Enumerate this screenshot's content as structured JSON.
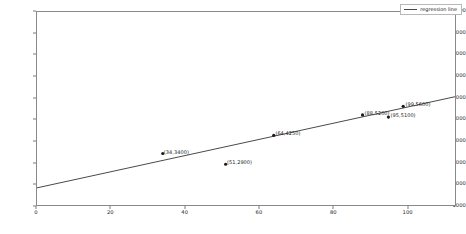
{
  "chart_data": {
    "type": "scatter",
    "title": "",
    "xlabel": "",
    "ylabel": "",
    "xlim": [
      0,
      113
    ],
    "ylim": [
      1000,
      10000
    ],
    "grid": false,
    "legend_position": "upper right",
    "legend": [
      "regression line"
    ],
    "x": [
      34,
      51,
      64,
      88,
      95,
      99
    ],
    "y": [
      3400,
      2900,
      4250,
      5200,
      5100,
      5600
    ],
    "point_labels": [
      "(34,3400)",
      "(51,2900)",
      "(64,4250)",
      "(88,5200)",
      "(95,5100)",
      "(99,5600)"
    ],
    "series": [
      {
        "name": "regression line",
        "type": "line",
        "x": [
          0,
          113
        ],
        "y": [
          1800,
          6050
        ],
        "color": "#4a4a4a"
      }
    ],
    "yticks": [
      1000,
      2000,
      3000,
      4000,
      5000,
      6000,
      7000,
      8000,
      9000,
      10000
    ],
    "ytick_labels": [
      "1000",
      "2000",
      "3000",
      "4000",
      "5000",
      "6000",
      "7000",
      "8000",
      "9000",
      "10000"
    ],
    "xticks": [
      0,
      20,
      40,
      60,
      80,
      100
    ],
    "xtick_labels": [
      "0",
      "20",
      "40",
      "60",
      "80",
      "100"
    ]
  },
  "legend": {
    "label": "regression line"
  },
  "caption": {
    "text": ""
  }
}
